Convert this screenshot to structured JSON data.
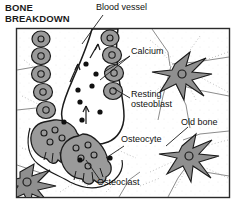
{
  "figure": {
    "title": "BONE\nBREAKDOWN",
    "type": "biological-illustration",
    "frame": {
      "x": 16,
      "y": 28,
      "width": 214,
      "height": 170,
      "border_color": "#2b2b2b"
    },
    "palette": {
      "cell_fill": "#9a9a9a",
      "cell_outline": "#1b1b1b",
      "matrix_fill": "#ffffff",
      "vessel_fill": "#ffffff",
      "calcium_dot": "#111111",
      "canaliculi": "#b8b8b8",
      "text": "#111111"
    },
    "labels": [
      {
        "id": "blood-vessel",
        "text": "Blood vessel"
      },
      {
        "id": "calcium",
        "text": "Calcium"
      },
      {
        "id": "resting-osteoblast",
        "text": "Resting\nosteoblast"
      },
      {
        "id": "old-bone",
        "text": "Old bone"
      },
      {
        "id": "osteocyte",
        "text": "Osteocyte"
      },
      {
        "id": "osteoclast",
        "text": "Osteoclast"
      }
    ],
    "structures": {
      "blood_vessel": {
        "description": "vertical channel running top-center to mid-left, lined by osteoblasts on both walls"
      },
      "osteoblast_rows": {
        "left_count": 5,
        "right_count": 4,
        "description": "chain of rounded cells with single nucleus lining the vessel"
      },
      "osteoclasts": {
        "count": 2,
        "description": "large multinucleated cells with ruffled borders eroding the bone surface",
        "nuclei_each": [
          4,
          5
        ]
      },
      "osteocytes": {
        "count": 3,
        "description": "star-shaped cells embedded in old bone matrix with radiating dendritic processes"
      },
      "calcium_dots": {
        "count": 10,
        "description": "black dots representing calcium released into the blood vessel"
      },
      "flow_arrows": {
        "count": 3,
        "description": "arrows indicating calcium movement into the vessel"
      }
    }
  }
}
